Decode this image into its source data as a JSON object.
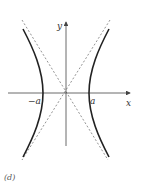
{
  "figure": {
    "caption": "(d)",
    "x_axis_label": "x",
    "y_axis_label": "y",
    "vertex_left_label": "−a",
    "vertex_right_label": "a",
    "curve": "hyperbola x²/a² − y²/b² = 1",
    "asymptotes": "dashed lines y = ±(b/a)x",
    "colors": {
      "curve": "#222222",
      "axes": "#444444",
      "asymptote": "#666666"
    }
  }
}
